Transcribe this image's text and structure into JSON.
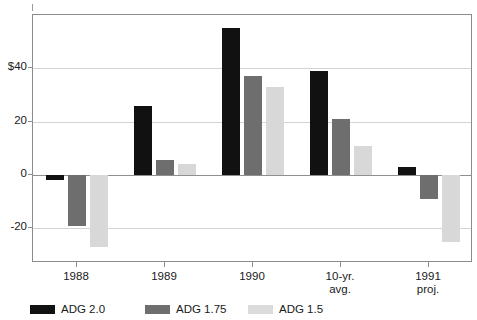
{
  "chart_data": {
    "type": "bar",
    "title": "",
    "subtitle": "",
    "xlabel": "",
    "ylabel": "",
    "categories": [
      "1988",
      "1989",
      "1990",
      "10-yr.\navg.",
      "1991\nproj."
    ],
    "category_lines": [
      {
        "line1": "1988",
        "line2": ""
      },
      {
        "line1": "1989",
        "line2": ""
      },
      {
        "line1": "1990",
        "line2": ""
      },
      {
        "line1": "10-yr.",
        "line2": "avg."
      },
      {
        "line1": "1991",
        "line2": "proj."
      }
    ],
    "series": [
      {
        "name": "ADG 2.0",
        "color": "#111111",
        "values": [
          -2,
          26,
          55,
          39,
          3
        ]
      },
      {
        "name": "ADG 1.75",
        "color": "#6e6e6e",
        "values": [
          -19,
          5.5,
          37,
          21,
          -9
        ]
      },
      {
        "name": "ADG 1.5",
        "color": "#d8d8d8",
        "values": [
          -27,
          4,
          33,
          11,
          -25
        ]
      }
    ],
    "ylim": [
      -33,
      60
    ],
    "yticks": [
      -20,
      0,
      20,
      40
    ],
    "ytick_labels": [
      "-20",
      "0",
      "20",
      "$40"
    ],
    "grid": true,
    "legend_position": "bottom-left",
    "zero_line": true
  },
  "legend": {
    "items": [
      {
        "label": "ADG 2.0",
        "swatch": "black-swatch"
      },
      {
        "label": "ADG 1.75",
        "swatch": "dark-gray-swatch"
      },
      {
        "label": "ADG 1.5",
        "swatch": "light-gray-swatch"
      }
    ]
  },
  "colors": {
    "series_black": "#111111",
    "series_dark_gray": "#6e6e6e",
    "series_light_gray": "#d8d8d8",
    "grid": "#d3d3d3",
    "axis": "#8c8c8c",
    "background": "#ffffff"
  }
}
